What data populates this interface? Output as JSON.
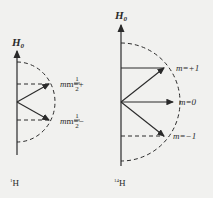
{
  "diagrams": [
    {
      "field_label": "H",
      "field_subscript": "0",
      "nucleus_mass": "1",
      "nucleus_symbol": "H",
      "states": [
        {
          "prefix": "m=+",
          "num": "1",
          "den": "2"
        },
        {
          "prefix": "m=−",
          "num": "1",
          "den": "2"
        }
      ]
    },
    {
      "field_label": "H",
      "field_subscript": "0",
      "nucleus_mass": "14",
      "nucleus_symbol": "H",
      "states": [
        {
          "label": "m=+1"
        },
        {
          "label": "m=0"
        },
        {
          "label": "m=−1"
        }
      ]
    }
  ],
  "colors": {
    "line": "#2a2a2a",
    "background": "#f1f1ef"
  }
}
